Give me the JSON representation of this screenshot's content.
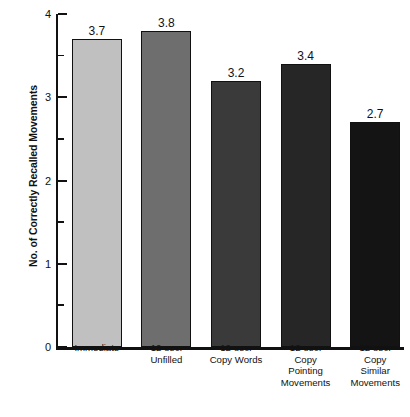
{
  "chart_data": {
    "type": "bar",
    "title": "",
    "subtitle": "",
    "xlabel": "",
    "ylabel": "No. of Correctly Recalled Movements",
    "categories": [
      "Immediate",
      "12-sec.\nUnfilled",
      "12-sec.\nCopy Words",
      "12-sec.\nCopy\nPointing\nMovements",
      "12-sec.\nCopy\nSimilar\nMovements"
    ],
    "values": [
      3.7,
      3.8,
      3.2,
      3.4,
      2.7
    ],
    "value_labels": [
      "3.7",
      "3.8",
      "3.2",
      "3.4",
      "2.7"
    ],
    "bar_colors": [
      "#c0c0c0",
      "#6e6e6e",
      "#3a3a3a",
      "#262626",
      "#141414"
    ],
    "bar_edge_color": "#111111",
    "ylim": [
      0,
      4
    ],
    "y_major_ticks": [
      0,
      1,
      2,
      3,
      4
    ],
    "y_major_tick_labels": [
      "0",
      "1",
      "2",
      "3",
      "4"
    ],
    "y_minor_ticks": [
      0.5,
      1.5,
      2.5,
      3.5
    ],
    "grid": false,
    "legend": null,
    "legend_position": "none",
    "axis_color": "#111111",
    "background_color": "#ffffff"
  }
}
